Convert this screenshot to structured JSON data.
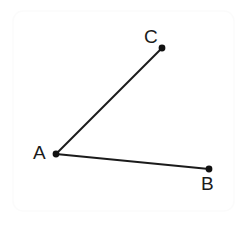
{
  "canvas": {
    "width": 249,
    "height": 225,
    "background_color": "#ffffff"
  },
  "frame": {
    "name": "panel-border",
    "x": 13,
    "y": 11,
    "width": 221,
    "height": 200,
    "corner_radius": 10,
    "stroke_color": "#fbfbfb",
    "stroke_width": 1.5,
    "fill_color": "#ffffff"
  },
  "figure": {
    "stroke_color": "#1b1b1b",
    "stroke_width": 2,
    "point_color": "#111111",
    "point_radius": 3.4,
    "points": [
      {
        "id": "A",
        "label": "A",
        "x": 56,
        "y": 154,
        "role": "vertex"
      },
      {
        "id": "B",
        "label": "B",
        "x": 209,
        "y": 169,
        "role": "endpoint"
      },
      {
        "id": "C",
        "label": "C",
        "x": 162,
        "y": 48,
        "role": "endpoint"
      }
    ],
    "segments": [
      {
        "id": "AB",
        "from": "A",
        "to": "B",
        "x1": 56,
        "y1": 154,
        "x2": 209,
        "y2": 169
      },
      {
        "id": "AC",
        "from": "A",
        "to": "C",
        "x1": 56,
        "y1": 154,
        "x2": 162,
        "y2": 48
      }
    ],
    "labels": [
      {
        "id": "A",
        "text": "A",
        "x": 33,
        "y": 143,
        "anchor": "left-of-vertex"
      },
      {
        "id": "B",
        "text": "B",
        "x": 201,
        "y": 174,
        "anchor": "below-right-of-point"
      },
      {
        "id": "C",
        "text": "C",
        "x": 144,
        "y": 27,
        "anchor": "above-left-of-point"
      }
    ]
  }
}
